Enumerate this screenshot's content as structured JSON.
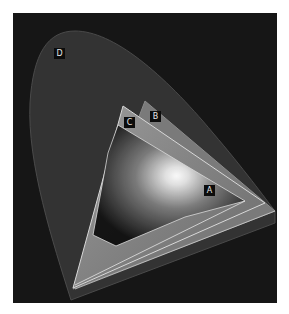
{
  "figure": {
    "title": ""
  },
  "gamuts": [
    {
      "id": "A",
      "label": "A"
    },
    {
      "id": "B",
      "label": "B"
    },
    {
      "id": "C",
      "label": "C"
    },
    {
      "id": "D",
      "label": "D"
    }
  ],
  "colors": {
    "background": "#161616",
    "spectral_locus": "#333333",
    "outline": "#d8d8d8"
  }
}
